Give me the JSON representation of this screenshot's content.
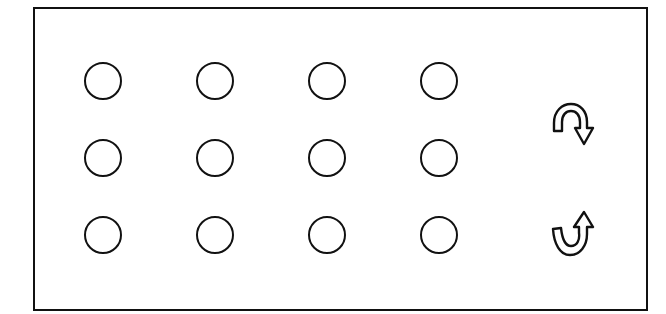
{
  "board": {
    "rows": 3,
    "cols": 4,
    "border_color": "#111111",
    "background": "#ffffff",
    "pegs": [
      {
        "row": 1,
        "col": 1,
        "cx": 103,
        "cy": 81,
        "state": "empty"
      },
      {
        "row": 1,
        "col": 2,
        "cx": 215,
        "cy": 81,
        "state": "empty"
      },
      {
        "row": 1,
        "col": 3,
        "cx": 327,
        "cy": 81,
        "state": "empty"
      },
      {
        "row": 1,
        "col": 4,
        "cx": 439,
        "cy": 81,
        "state": "empty"
      },
      {
        "row": 2,
        "col": 1,
        "cx": 103,
        "cy": 158,
        "state": "empty"
      },
      {
        "row": 2,
        "col": 2,
        "cx": 215,
        "cy": 158,
        "state": "empty"
      },
      {
        "row": 2,
        "col": 3,
        "cx": 327,
        "cy": 158,
        "state": "empty"
      },
      {
        "row": 2,
        "col": 4,
        "cx": 439,
        "cy": 158,
        "state": "empty"
      },
      {
        "row": 3,
        "col": 1,
        "cx": 103,
        "cy": 235,
        "state": "empty"
      },
      {
        "row": 3,
        "col": 2,
        "cx": 215,
        "cy": 235,
        "state": "empty"
      },
      {
        "row": 3,
        "col": 3,
        "cx": 327,
        "cy": 235,
        "state": "empty"
      },
      {
        "row": 3,
        "col": 4,
        "cx": 439,
        "cy": 235,
        "state": "empty"
      }
    ]
  },
  "controls": {
    "rotate_clockwise": {
      "icon": "rotate-clockwise-icon",
      "label": "Rotate clockwise"
    },
    "rotate_counterclockwise": {
      "icon": "rotate-counterclockwise-icon",
      "label": "Rotate counterclockwise"
    }
  }
}
